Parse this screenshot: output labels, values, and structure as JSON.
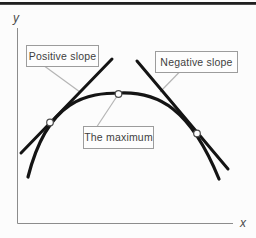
{
  "diagram": {
    "axes": {
      "y_label": "y",
      "x_label": "x"
    },
    "callouts": {
      "positive_slope": "Positive slope",
      "negative_slope": "Negative slope",
      "maximum": "The maximum"
    },
    "markers": {
      "count": 3,
      "names": [
        "left-tangent-point",
        "maximum-point",
        "right-tangent-point"
      ]
    },
    "colors": {
      "background": "#fcfcfc",
      "top_rule": "#1f1f1f",
      "axis": "#8c8c8c",
      "axis_text": "#4a4a4a",
      "curve": "#141414",
      "tangent": "#141414",
      "leader": "#b5b5b5",
      "box_fill": "#fdfdfd",
      "box_border": "#9c9c9c",
      "box_text": "#3f3f3f",
      "marker_fill": "#ffffff",
      "marker_stroke": "#4d4d4d"
    }
  }
}
